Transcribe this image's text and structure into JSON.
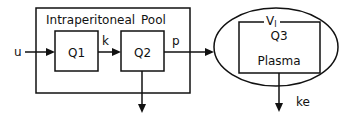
{
  "diagram": {
    "outer_box": {
      "top_labels": [
        "Intraperitoneal",
        "Pool"
      ]
    },
    "compartments": [
      {
        "id": "q1",
        "label": "Q1"
      },
      {
        "id": "q2",
        "label": "Q2"
      },
      {
        "id": "q3",
        "label": "Q3",
        "volume_label": "V",
        "volume_subscript": "I",
        "sublabel": "Plasma"
      }
    ],
    "flows": [
      {
        "from": "input",
        "to": "q1",
        "label": "u"
      },
      {
        "from": "q1",
        "to": "q2",
        "label": "k"
      },
      {
        "from": "q2",
        "to": "q3",
        "label": "p"
      },
      {
        "from": "q2",
        "to": "out",
        "label": ""
      },
      {
        "from": "q3",
        "to": "out",
        "label": "ke"
      }
    ],
    "colors": {
      "stroke": "#111111",
      "background": "#ffffff"
    }
  }
}
